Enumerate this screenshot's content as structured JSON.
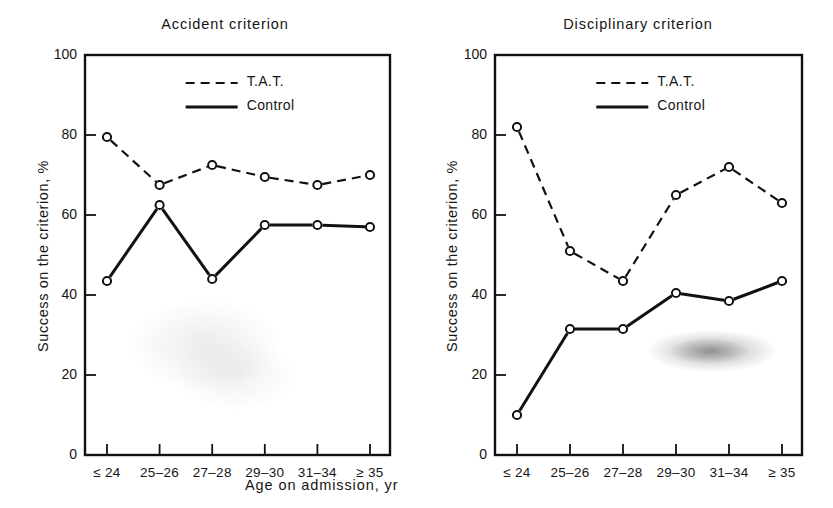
{
  "figure": {
    "background": "#ffffff",
    "ink_color": "#111111",
    "xlabel": "Age on admission, yr"
  },
  "axis": {
    "ylabel": "Success on the criterion, %",
    "y_ticks": [
      "0",
      "20",
      "40",
      "60",
      "80",
      "100"
    ],
    "y_tick_values": [
      0,
      20,
      40,
      60,
      80,
      100
    ],
    "ylim": [
      0,
      100
    ],
    "x_ticks": [
      "≤ 24",
      "25–26",
      "27–28",
      "29–30",
      "31–34",
      "≥ 35"
    ]
  },
  "legend": {
    "tat_label": "T.A.T.",
    "control_label": "Control",
    "position": "top-center-inside"
  },
  "panels": {
    "left": {
      "title": "Accident criterion"
    },
    "right": {
      "title": "Disciplinary criterion"
    }
  },
  "chart_data": [
    {
      "type": "line",
      "title": "Accident criterion",
      "xlabel": "Age on admission, yr",
      "ylabel": "Success on the criterion, %",
      "categories": [
        "≤ 24",
        "25–26",
        "27–28",
        "29–30",
        "31–34",
        "≥ 35"
      ],
      "ylim": [
        0,
        100
      ],
      "yticks": [
        0,
        20,
        40,
        60,
        80,
        100
      ],
      "grid": false,
      "legend": [
        "T.A.T.",
        "Control"
      ],
      "legend_position": "upper center inside axes",
      "marker": "open-circle",
      "series": [
        {
          "name": "T.A.T.",
          "style": "dashed",
          "values": [
            79.5,
            67.5,
            72.5,
            69.5,
            67.5,
            70.0
          ]
        },
        {
          "name": "Control",
          "style": "solid",
          "values": [
            43.5,
            62.5,
            44.0,
            57.5,
            57.5,
            57.0
          ]
        }
      ]
    },
    {
      "type": "line",
      "title": "Disciplinary criterion",
      "xlabel": "Age on admission, yr",
      "ylabel": "Success on the criterion, %",
      "categories": [
        "≤ 24",
        "25–26",
        "27–28",
        "29–30",
        "31–34",
        "≥ 35"
      ],
      "ylim": [
        0,
        100
      ],
      "yticks": [
        0,
        20,
        40,
        60,
        80,
        100
      ],
      "grid": false,
      "legend": [
        "T.A.T.",
        "Control"
      ],
      "legend_position": "upper center inside axes",
      "marker": "open-circle",
      "series": [
        {
          "name": "T.A.T.",
          "style": "dashed",
          "values": [
            82.0,
            51.0,
            43.5,
            65.0,
            72.0,
            63.0
          ]
        },
        {
          "name": "Control",
          "style": "solid",
          "values": [
            10.0,
            31.5,
            31.5,
            40.5,
            38.5,
            43.5
          ]
        }
      ]
    }
  ]
}
